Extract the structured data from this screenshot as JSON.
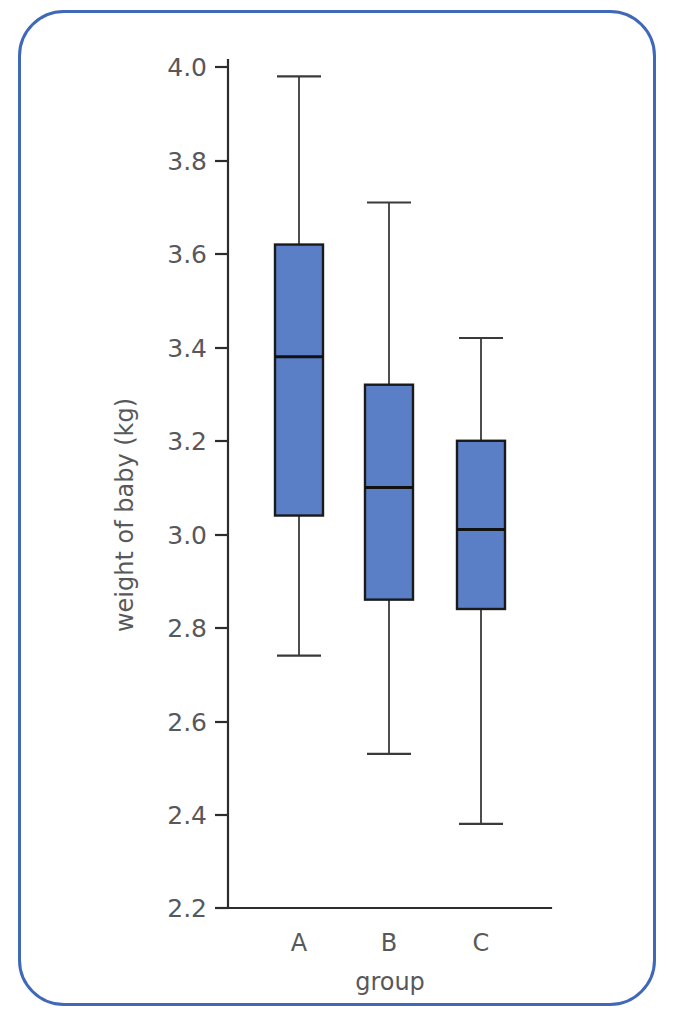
{
  "frame": {
    "border_color": "#3f68b8"
  },
  "chart_data": {
    "type": "box",
    "title": "",
    "subtitle": "",
    "xlabel": "group",
    "ylabel": "weight of baby (kg)",
    "categories": [
      "A",
      "B",
      "C"
    ],
    "ylim": [
      2.2,
      4.0
    ],
    "yticks": [
      2.2,
      2.4,
      2.6,
      2.8,
      3.0,
      3.2,
      3.4,
      3.6,
      3.8,
      4.0
    ],
    "ytick_labels": [
      "2.2",
      "2.4",
      "2.6",
      "2.8",
      "3.0",
      "3.2",
      "3.4",
      "3.6",
      "3.8",
      "4.0"
    ],
    "grid": false,
    "legend": null,
    "box_fill_color": "#5b7fc7",
    "box_edge_color": "#1a1a1a",
    "boxes": [
      {
        "label": "A",
        "whisker_low": 2.74,
        "q1": 3.04,
        "median": 3.38,
        "q3": 3.62,
        "whisker_high": 3.98
      },
      {
        "label": "B",
        "whisker_low": 2.53,
        "q1": 2.86,
        "median": 3.1,
        "q3": 3.32,
        "whisker_high": 3.71
      },
      {
        "label": "C",
        "whisker_low": 2.38,
        "q1": 2.84,
        "median": 3.01,
        "q3": 3.2,
        "whisker_high": 3.42
      }
    ]
  }
}
